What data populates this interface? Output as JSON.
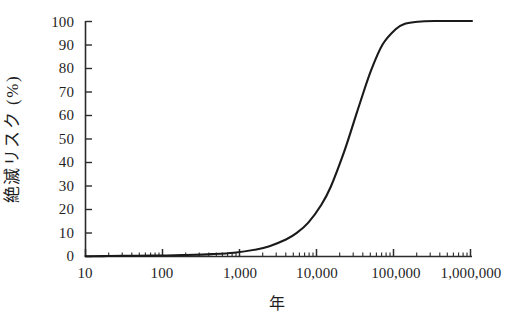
{
  "chart_data": {
    "type": "line",
    "title": "",
    "subtitle": "",
    "xlabel": "年",
    "ylabel": "絶滅リスク (%)",
    "xscale": "log",
    "yscale": "linear",
    "xlim": [
      10,
      1600000
    ],
    "ylim": [
      0,
      100
    ],
    "grid": false,
    "legend": null,
    "xtick_labels": [
      "10",
      "100",
      "1,000",
      "10,000",
      "100,000",
      "1,000,000"
    ],
    "xtick_values": [
      10,
      100,
      1000,
      10000,
      100000,
      1000000
    ],
    "ytick_labels": [
      "0",
      "10",
      "20",
      "30",
      "40",
      "50",
      "60",
      "70",
      "80",
      "90",
      "100"
    ],
    "ytick_values": [
      0,
      10,
      20,
      30,
      40,
      50,
      60,
      70,
      80,
      90,
      100
    ],
    "series": [
      {
        "name": "絶滅リスク",
        "color": "#1a1a1a",
        "x": [
          10,
          20,
          50,
          100,
          200,
          500,
          1000,
          2000,
          3000,
          5000,
          7000,
          10000,
          15000,
          20000,
          30000,
          40000,
          50000,
          70000,
          100000,
          150000,
          200000,
          300000,
          500000,
          1000000,
          1600000
        ],
        "y": [
          0.1,
          0.2,
          0.3,
          0.4,
          0.6,
          1.0,
          1.6,
          3.0,
          4.4,
          7.2,
          10.0,
          14.4,
          22.0,
          29.5,
          44.0,
          56.0,
          65.5,
          79.0,
          90.0,
          96.5,
          98.8,
          99.7,
          100.0,
          100.0,
          100.0
        ]
      }
    ],
    "annotations": []
  },
  "axes": {
    "y_title": "絶滅リスク (%)",
    "x_title": "年",
    "ytick_labels": [
      "100",
      "90",
      "80",
      "70",
      "60",
      "50",
      "40",
      "30",
      "20",
      "10",
      "0"
    ],
    "xtick_labels": [
      "10",
      "100",
      "1,000",
      "10,000",
      "100,000",
      "1,000,000"
    ]
  },
  "style": {
    "axis_color": "#2b2b2b",
    "curve_color": "#1a1a1a",
    "background": "#ffffff"
  }
}
